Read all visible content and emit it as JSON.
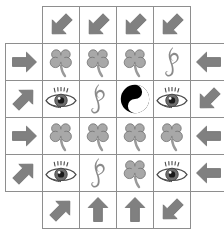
{
  "board": {
    "name": "symbol-arrow-puzzle-grid",
    "rows": 6,
    "cols": 6,
    "cell_size": 37,
    "origin_x": 5,
    "origin_y": 6,
    "colors": {
      "grid_line": "#8e8e8e",
      "cell_background": "#ffffff",
      "arrow_fill": "#808080",
      "arrow_stroke": "#6e6e6e",
      "clover_fill": "#a8a8a8",
      "clover_stroke": "#707070",
      "clover_stem": "#9a9a9a",
      "clef_fill": "#8a8a8a",
      "eye_outline": "#4a4a4a",
      "eye_iris": "#6e6e6e",
      "eye_pupil": "#1a1a1a",
      "yinyang_dark": "#000000",
      "yinyang_light": "#ffffff",
      "page_background": "#ffffff"
    },
    "cells": [
      [
        {
          "icon": "empty",
          "label": "empty"
        },
        {
          "icon": "arrow-southwest",
          "label": "arrow pointing down-left"
        },
        {
          "icon": "arrow-southwest",
          "label": "arrow pointing down-left"
        },
        {
          "icon": "arrow-southwest",
          "label": "arrow pointing down-left"
        },
        {
          "icon": "arrow-southwest",
          "label": "arrow pointing down-left"
        },
        {
          "icon": "empty",
          "label": "empty"
        }
      ],
      [
        {
          "icon": "arrow-east",
          "label": "arrow pointing right"
        },
        {
          "icon": "clover",
          "label": "four leaf clover"
        },
        {
          "icon": "clover",
          "label": "four leaf clover"
        },
        {
          "icon": "clover",
          "label": "four leaf clover"
        },
        {
          "icon": "clef",
          "label": "treble clef"
        },
        {
          "icon": "arrow-west",
          "label": "arrow pointing left"
        }
      ],
      [
        {
          "icon": "arrow-northeast",
          "label": "arrow pointing up-right"
        },
        {
          "icon": "eye",
          "label": "eye"
        },
        {
          "icon": "clef",
          "label": "treble clef"
        },
        {
          "icon": "yinyang",
          "label": "yin yang"
        },
        {
          "icon": "eye",
          "label": "eye"
        },
        {
          "icon": "arrow-southwest",
          "label": "arrow pointing down-left"
        }
      ],
      [
        {
          "icon": "arrow-east",
          "label": "arrow pointing right"
        },
        {
          "icon": "clover",
          "label": "four leaf clover"
        },
        {
          "icon": "clover",
          "label": "four leaf clover"
        },
        {
          "icon": "clover",
          "label": "four leaf clover"
        },
        {
          "icon": "clover",
          "label": "four leaf clover"
        },
        {
          "icon": "arrow-west",
          "label": "arrow pointing left"
        }
      ],
      [
        {
          "icon": "arrow-northeast",
          "label": "arrow pointing up-right"
        },
        {
          "icon": "eye",
          "label": "eye"
        },
        {
          "icon": "clef",
          "label": "treble clef"
        },
        {
          "icon": "clover",
          "label": "four leaf clover"
        },
        {
          "icon": "eye",
          "label": "eye"
        },
        {
          "icon": "arrow-west",
          "label": "arrow pointing left"
        }
      ],
      [
        {
          "icon": "empty",
          "label": "empty"
        },
        {
          "icon": "arrow-northeast",
          "label": "arrow pointing up-right"
        },
        {
          "icon": "arrow-north",
          "label": "arrow pointing up"
        },
        {
          "icon": "arrow-north",
          "label": "arrow pointing up"
        },
        {
          "icon": "arrow-southwest",
          "label": "arrow pointing down-left"
        },
        {
          "icon": "empty",
          "label": "empty"
        }
      ]
    ]
  }
}
